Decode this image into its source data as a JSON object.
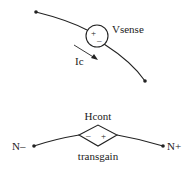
{
  "vsense": {
    "label": "Vsense",
    "plus": "+",
    "minus": "–",
    "current_label": "Ic"
  },
  "hcont": {
    "top_label": "Hcont",
    "bottom_label": "transgain",
    "minus": "–",
    "plus": "+",
    "left_node": "N–",
    "right_node": "N+"
  }
}
